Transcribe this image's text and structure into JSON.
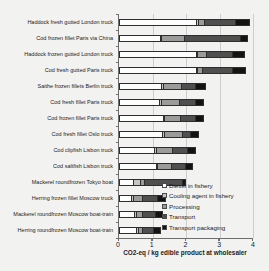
{
  "chart_data": {
    "type": "bar",
    "orientation": "horizontal",
    "stacked": true,
    "title": "",
    "xlabel": "CO2-eq / kg edible product at wholesaler",
    "ylabel": "",
    "xlim": [
      0,
      4
    ],
    "xticks": [
      "0",
      "1",
      "2",
      "3",
      "4"
    ],
    "grid": "vertical gridlines at each x tick",
    "legend_position": "inside bottom-right",
    "categories": [
      "Haddock fresh gutted London truck",
      "Cod frozen fillet Paris via China",
      "Haddock frozen gutted London truck",
      "Cod fresh gutted Paris truck",
      "Saithe frozen fillets Berlin truck",
      "Cod fresh fillet Paris truck",
      "Cod frozen fillet Paris truck",
      "Cod fresh fillet Oslo truck",
      "Cod clipfish Lisbon truck",
      "Cod saltfish Lisbon truck",
      "Mackerel roundfrozen Tokyo boat",
      "Herring frozen fillet Moscow truck",
      "Mackerel roundfrozen Moscow boat-train",
      "Herring roundfrozen Moscow boat-train"
    ],
    "series": [
      {
        "name": "Diesel in fishery",
        "color": "#fdfdfd",
        "values": [
          2.3,
          1.2,
          2.3,
          2.3,
          1.25,
          1.2,
          1.3,
          1.3,
          1.05,
          1.1,
          0.4,
          0.35,
          0.45,
          0.5
        ]
      },
      {
        "name": "Cooling agent in fishery",
        "color": "#c4c4c4",
        "values": [
          0.05,
          0.05,
          0.05,
          0.05,
          0.05,
          0.05,
          0.05,
          0.05,
          0.05,
          0.05,
          0.2,
          0.05,
          0.05,
          0.05
        ]
      },
      {
        "name": "Processing",
        "color": "#9b9b9b",
        "values": [
          0.2,
          0.7,
          0.25,
          0.15,
          0.55,
          0.55,
          0.5,
          0.55,
          0.5,
          0.4,
          0.15,
          0.3,
          0.2,
          0.15
        ]
      },
      {
        "name": "Transport",
        "color": "#4f4f4f",
        "values": [
          0.95,
          1.7,
          0.8,
          0.9,
          0.45,
          0.5,
          0.45,
          0.25,
          0.45,
          0.45,
          1.15,
          0.45,
          0.4,
          0.35
        ]
      },
      {
        "name": "Transport packaging",
        "color": "#131313",
        "values": [
          0.4,
          0.2,
          0.35,
          0.4,
          0.3,
          0.25,
          0.25,
          0.25,
          0.25,
          0.2,
          0.1,
          0.25,
          0.2,
          0.2
        ]
      }
    ],
    "totals": [
      3.9,
      3.85,
      3.75,
      3.8,
      2.6,
      2.55,
      2.55,
      2.4,
      2.3,
      2.2,
      2.0,
      1.4,
      1.3,
      1.25
    ]
  }
}
